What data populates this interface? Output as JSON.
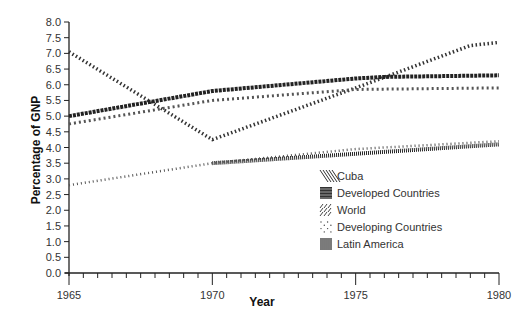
{
  "chart_data": {
    "type": "line",
    "title": "",
    "xlabel": "Year",
    "ylabel": "Percentage of GNP",
    "xlim": [
      1965,
      1980
    ],
    "ylim": [
      0,
      8
    ],
    "x_ticks": [
      "1965",
      "1970",
      "1975",
      "1980"
    ],
    "y_ticks": [
      "0.0",
      "0.5",
      "1.0",
      "1.5",
      "2.0",
      "2.5",
      "3.0",
      "3.5",
      "4.0",
      "4.5",
      "5.0",
      "5.5",
      "6.0",
      "6.5",
      "7.0",
      "7.5",
      "8.0"
    ],
    "grid": false,
    "legend_position": "inside-lower-right",
    "series": [
      {
        "name": "Cuba",
        "pattern": "diagonal-dashes",
        "x": [
          1965,
          1970,
          1975,
          1979,
          1980
        ],
        "values": [
          7.05,
          4.25,
          5.9,
          7.25,
          7.35
        ]
      },
      {
        "name": "Developed Countries",
        "pattern": "chain-dense",
        "x": [
          1965,
          1970,
          1975,
          1976,
          1980
        ],
        "values": [
          5.0,
          5.8,
          6.2,
          6.25,
          6.3
        ]
      },
      {
        "name": "World",
        "pattern": "sparse-slashes",
        "x": [
          1965,
          1970,
          1975,
          1980
        ],
        "values": [
          4.75,
          5.5,
          5.85,
          5.9
        ]
      },
      {
        "name": "Developing Countries",
        "pattern": "dotted",
        "x": [
          1965,
          1970,
          1975,
          1980
        ],
        "values": [
          2.8,
          3.5,
          3.95,
          4.2
        ]
      },
      {
        "name": "Latin America",
        "pattern": "vertical-bars",
        "x": [
          1970,
          1975,
          1980
        ],
        "values": [
          3.5,
          3.8,
          4.1
        ]
      }
    ]
  }
}
